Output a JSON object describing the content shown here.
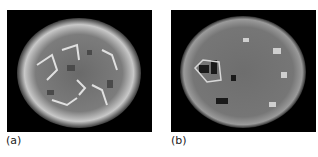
{
  "figure": {
    "panels": [
      {
        "id": "a",
        "label": "(a)",
        "description": "grayscale scan of a round specimen with bright rim and mottled interior"
      },
      {
        "id": "b",
        "label": "(b)",
        "description": "grayscale scan of a round specimen, darker uniform interior with dark spots on left"
      }
    ]
  }
}
